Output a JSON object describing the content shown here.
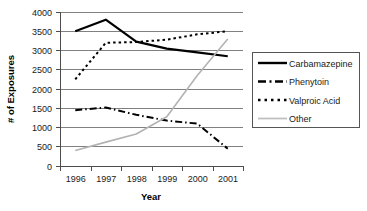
{
  "chart_data": {
    "type": "line",
    "title": "",
    "xlabel": "Year",
    "ylabel": "# of Exposures",
    "categories": [
      "1996",
      "1997",
      "1998",
      "1999",
      "2000",
      "2001"
    ],
    "x": [
      1996,
      1997,
      1998,
      1999,
      2000,
      2001
    ],
    "ylim": [
      0,
      4000
    ],
    "yticks": [
      0,
      500,
      1000,
      1500,
      2000,
      2500,
      3000,
      3500,
      4000
    ],
    "ytick_labels": [
      "0",
      "500",
      "1000",
      "1500",
      "2000",
      "2500",
      "3000",
      "3500",
      "4000"
    ],
    "grid": true,
    "legend_position": "right",
    "series": [
      {
        "name": "Carbamazepine",
        "values": [
          3500,
          3800,
          3230,
          3050,
          2950,
          2850
        ],
        "style": "solid",
        "color": "#000000",
        "width": 2.2
      },
      {
        "name": "Phenytoin",
        "values": [
          1450,
          1520,
          1330,
          1180,
          1100,
          450
        ],
        "style": "dash-dot",
        "color": "#000000",
        "width": 2.0
      },
      {
        "name": "Valproic Acid",
        "values": [
          2250,
          3200,
          3220,
          3280,
          3420,
          3500
        ],
        "style": "dotted",
        "color": "#000000",
        "width": 2.0
      },
      {
        "name": "Other",
        "values": [
          400,
          620,
          830,
          1280,
          2350,
          3300
        ],
        "style": "solid",
        "color": "#b3b3b3",
        "width": 1.6
      }
    ]
  },
  "legend": {
    "entries": [
      {
        "label": "Carbamazepine"
      },
      {
        "label": "Phenytoin"
      },
      {
        "label": "Valproic Acid"
      },
      {
        "label": "Other"
      }
    ]
  },
  "axes": {
    "x_title": "Year",
    "y_title": "# of Exposures"
  }
}
